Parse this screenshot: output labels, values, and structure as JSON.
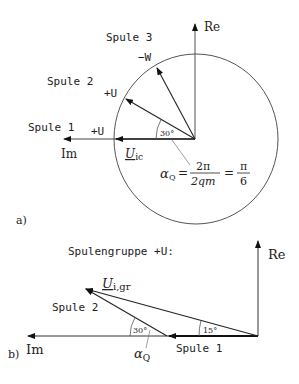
{
  "diagram_a": {
    "panel_label": "a)",
    "axis_re": "Re",
    "axis_im": "Im",
    "coils": [
      {
        "name": "Spule 1",
        "phase": "+U",
        "angle_deg": 0
      },
      {
        "name": "Spule 2",
        "phase": "+U",
        "angle_deg": 30
      },
      {
        "name": "Spule 3",
        "phase": "−W",
        "angle_deg": 60
      }
    ],
    "vector_label_main": "U",
    "vector_label_sub": "ic",
    "angle_label": "30°",
    "formula": {
      "lhs_symbol": "α",
      "lhs_sub": "Q",
      "frac1_num": "2π",
      "frac1_den": "2qm",
      "frac2_num": "π",
      "frac2_den": "6",
      "eq": "="
    }
  },
  "diagram_b": {
    "panel_label": "b)",
    "title": "Spulengruppe +U:",
    "axis_re": "Re",
    "axis_im": "Im",
    "coil1": "Spule 1",
    "coil2": "Spule 2",
    "result_main": "U",
    "result_sub": "i,gr",
    "angle_result": "15°",
    "angle_q": "30°",
    "alpha_symbol": "α",
    "alpha_sub": "Q"
  }
}
